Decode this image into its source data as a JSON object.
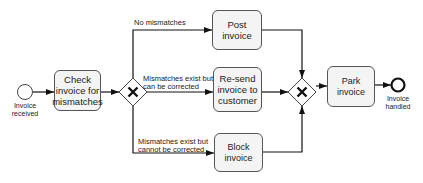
{
  "diagram": {
    "type": "BPMN process",
    "events": {
      "start": {
        "label_line1": "Invoice",
        "label_line2": "received"
      },
      "end": {
        "label_line1": "Invoice",
        "label_line2": "handled"
      }
    },
    "tasks": {
      "check": {
        "line1": "Check",
        "line2": "invoice for",
        "line3": "mismatches"
      },
      "post": {
        "label": "Post invoice"
      },
      "resend": {
        "line1": "Re-send",
        "line2": "invoice to",
        "line3": "customer"
      },
      "block": {
        "label": "Block invoice"
      },
      "park": {
        "label": "Park invoice"
      }
    },
    "gateways": {
      "split": {
        "type": "exclusive",
        "symbol": "X"
      },
      "merge": {
        "type": "exclusive",
        "symbol": "X"
      }
    },
    "flows": {
      "no_mismatch": {
        "label": "No mismatches"
      },
      "correctable": {
        "line1": "Mismatches exist but",
        "line2": "can be corrected"
      },
      "not_correctable": {
        "line1": "Mismatches exist but",
        "line2": "cannot be corrected"
      }
    }
  }
}
